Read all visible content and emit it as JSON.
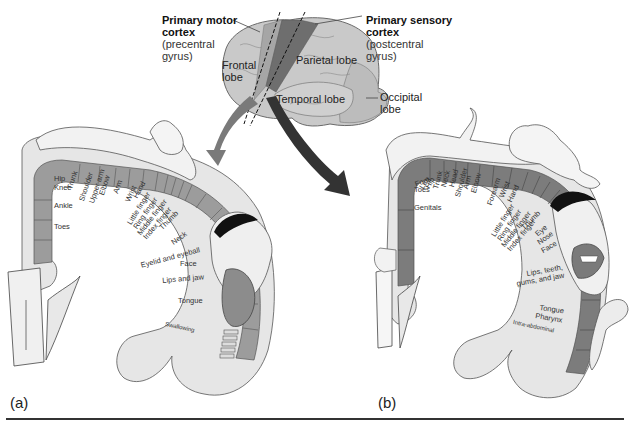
{
  "brain": {
    "motor_cortex": {
      "title_line1": "Primary motor",
      "title_line2": "cortex",
      "sub_line1": "(precentral",
      "sub_line2": "gyrus)"
    },
    "sensory_cortex": {
      "title_line1": "Primary sensory",
      "title_line2": "cortex",
      "sub_line1": "(postcentral",
      "sub_line2": "gyrus)"
    },
    "lobes": {
      "frontal_line1": "Frontal",
      "frontal_line2": "lobe",
      "parietal": "Parietal lobe",
      "temporal": "Temporal lobe",
      "occipital_line1": "Occipital",
      "occipital_line2": "lobe"
    },
    "colors": {
      "brain": "#c8c8c8",
      "motor_strip": "#9a9a9a",
      "sensory_strip": "#6e6e6e",
      "arrow_motor": "#777777",
      "arrow_sensory": "#333333"
    }
  },
  "panel_a": {
    "label": "(a)",
    "title": "Motor homunculus",
    "regions": [
      "Hip",
      "Knee",
      "Ankle",
      "Toes",
      "Trunk",
      "Shoulder",
      "Upper arm",
      "Elbow",
      "Arm",
      "Wrist",
      "Hand",
      "Little finger",
      "Ring finger",
      "Middle finger",
      "Index finger",
      "Thumb",
      "Neck",
      "Eyelid and eyeball",
      "Face",
      "Lips and jaw",
      "Tongue",
      "Swallowing"
    ]
  },
  "panel_b": {
    "label": "(b)",
    "title": "Sensory homunculus",
    "regions": [
      "Leg",
      "Hip",
      "Foot",
      "Toes",
      "Genitals",
      "Trunk",
      "Neck",
      "Head",
      "Shoulder",
      "Arm",
      "Elbow",
      "Forearm",
      "Wrist",
      "Hand",
      "Little finger",
      "Ring finger",
      "Middle finger",
      "Index finger",
      "Thumb",
      "Eye",
      "Nose",
      "Face",
      "Lips, teeth,",
      "gums, and jaw",
      "Tongue",
      "Pharynx",
      "Intra-abdominal"
    ]
  }
}
